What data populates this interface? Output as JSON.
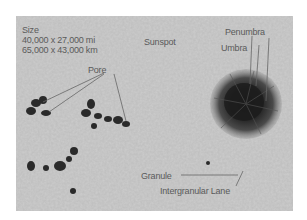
{
  "figure": {
    "size_block": {
      "heading": "Size",
      "line1": "40,000 x 27,000 mi",
      "line2": "65,000 x 43,000 km"
    },
    "labels": {
      "sunspot": "Sunspot",
      "penumbra": "Penumbra",
      "umbra": "Umbra",
      "pore": "Pore",
      "granule": "Granule",
      "intergranular_lane": "Intergranular Lane"
    },
    "colors": {
      "background": "#b8b8b8",
      "umbra": "#1e1e1e",
      "penumbra": "#4a4a4a",
      "label_text": "#5a5a5a"
    }
  }
}
